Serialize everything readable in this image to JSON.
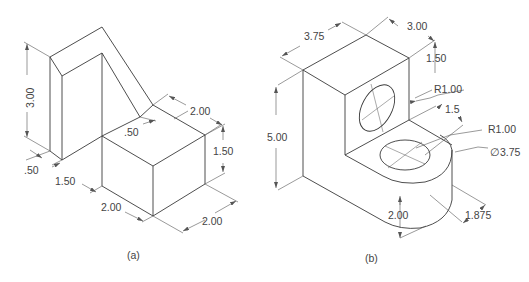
{
  "figure_a": {
    "caption": "(a)",
    "dimensions": {
      "height_upright": "3.00",
      "thickness_left": ".50",
      "depth_base": "1.50",
      "width_block": "2.00",
      "depth_block": "2.00",
      "height_block": "1.50",
      "top_width": "2.00",
      "slot_offset": ".50"
    }
  },
  "figure_b": {
    "caption": "(b)",
    "dimensions": {
      "width": "3.75",
      "depth": "3.00",
      "height": "5.00",
      "hole_vertical_offset": "1.50",
      "hole_vertical_radius": "R1.00",
      "hole_horizontal_offset": "1.5",
      "hole_horizontal_radius": "R1.00",
      "boss_diameter": "∅3.75",
      "boss_height": "2.00",
      "boss_offset": "1.875"
    }
  }
}
